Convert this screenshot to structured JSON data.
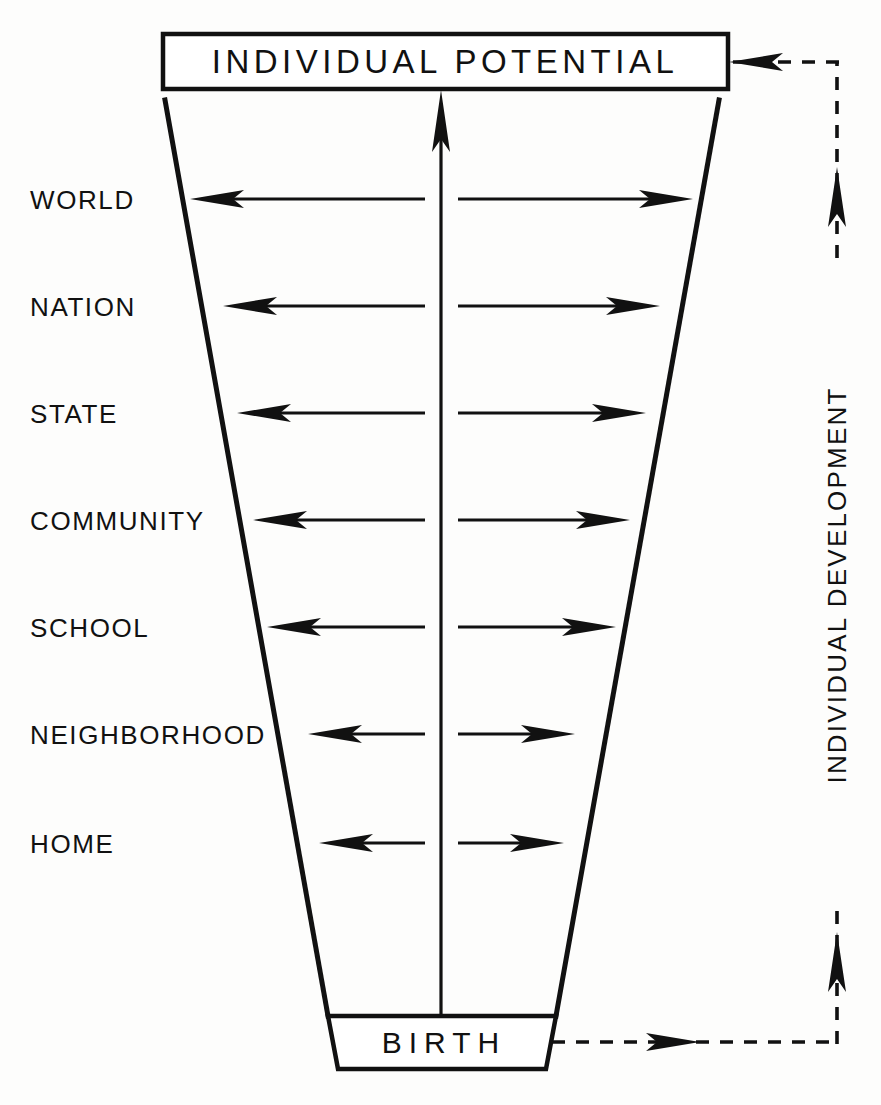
{
  "diagram": {
    "title_box": {
      "label": "INDIVIDUAL  POTENTIAL"
    },
    "bottom_box": {
      "label": "BIRTH"
    },
    "side_label": {
      "label": "INDIVIDUAL DEVELOPMENT"
    },
    "levels": [
      {
        "label": "WORLD"
      },
      {
        "label": "NATION"
      },
      {
        "label": "STATE"
      },
      {
        "label": "COMMUNITY"
      },
      {
        "label": "SCHOOL"
      },
      {
        "label": "NEIGHBORHOOD"
      },
      {
        "label": "HOME"
      }
    ],
    "colors": {
      "ink": "#111111",
      "paper": "#fdfdfc"
    }
  }
}
